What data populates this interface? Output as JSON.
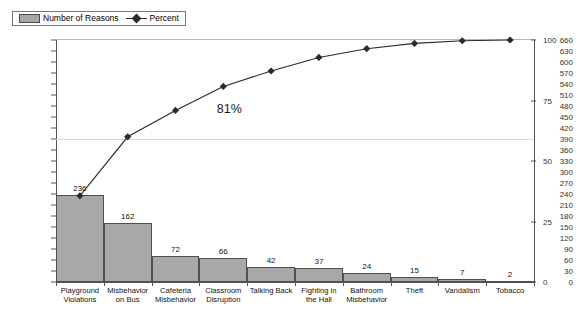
{
  "legend": {
    "items": [
      {
        "label": "Number of Reasons",
        "type": "bar-swatch",
        "color": "#a8a8a8"
      },
      {
        "label": "Percent",
        "type": "line-marker",
        "color": "#2b2b2b"
      }
    ]
  },
  "annotation": {
    "text": "81%",
    "x_index": 3
  },
  "chart_data": {
    "type": "bar",
    "subtype": "pareto",
    "title": "",
    "xlabel": "",
    "ylabel": "",
    "categories": [
      "Playground\nViolations",
      "Misbehavior\non Bus",
      "Cafeteria\nMisbehavior",
      "Classroom\nDisruption",
      "Talking Back",
      "Fighting in\nthe Hall",
      "Bathroom\nMisbehavior",
      "Theft",
      "Vandalism",
      "Tobacco"
    ],
    "category_lines": [
      [
        "Playground",
        "Violations"
      ],
      [
        "Misbehavior",
        "on Bus"
      ],
      [
        "Cafeteria",
        "Misbehavior"
      ],
      [
        "Classroom",
        "Disruption"
      ],
      [
        "Talking Back"
      ],
      [
        "Fighting in",
        "the Hall"
      ],
      [
        "Bathroom",
        "Misbehavior"
      ],
      [
        "Theft"
      ],
      [
        "Vandalism"
      ],
      [
        "Tobacco"
      ]
    ],
    "series": [
      {
        "name": "Number of Reasons",
        "type": "bar",
        "axis": "left",
        "values": [
          236,
          162,
          72,
          66,
          42,
          37,
          24,
          15,
          7,
          2
        ],
        "labels": [
          "236",
          "162",
          "72",
          "66",
          "42",
          "37",
          "24",
          "15",
          "7",
          "2"
        ],
        "color": "#a8a8a8"
      },
      {
        "name": "Percent",
        "type": "line",
        "axis": "right",
        "values": [
          35.6,
          60.0,
          70.9,
          80.8,
          87.2,
          92.8,
          96.4,
          98.6,
          99.7,
          100.0
        ],
        "color": "#2b2b2b",
        "marker": "diamond"
      }
    ],
    "y_left": {
      "min": 0,
      "max": 660,
      "step": 30,
      "ticks": [
        0,
        30,
        60,
        90,
        120,
        150,
        180,
        210,
        240,
        270,
        300,
        330,
        360,
        390,
        420,
        450,
        480,
        510,
        540,
        570,
        600,
        630,
        660
      ]
    },
    "y_right": {
      "min": 0,
      "max": 100,
      "step": 25,
      "ticks": [
        0,
        25,
        50,
        75,
        100
      ]
    },
    "gridlines": {
      "left_values": [
        390,
        660
      ],
      "visible": true
    },
    "legend_position": "top-left"
  }
}
